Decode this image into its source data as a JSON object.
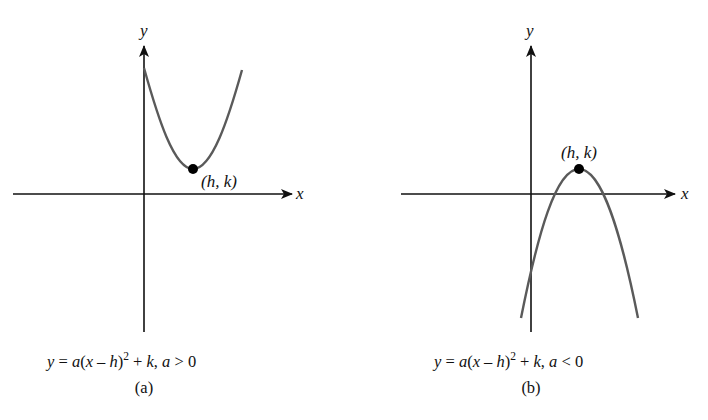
{
  "figure": {
    "panels": [
      {
        "id": "a",
        "x_axis_label": "x",
        "y_axis_label": "y",
        "vertex_label": "(h, k)",
        "equation": {
          "y": "y",
          "eq": " = ",
          "a": "a",
          "open": "(",
          "x": "x",
          "minus": " – ",
          "h": "h",
          "close": ")",
          "exp": "2",
          "plus": " + ",
          "k": "k",
          "comma": ", ",
          "a2": "a",
          "cond": " > 0"
        },
        "sublabel": "(a)",
        "opens": "up"
      },
      {
        "id": "b",
        "x_axis_label": "x",
        "y_axis_label": "y",
        "vertex_label": "(h, k)",
        "equation": {
          "y": "y",
          "eq": " = ",
          "a": "a",
          "open": "(",
          "x": "x",
          "minus": " – ",
          "h": "h",
          "close": ")",
          "exp": "2",
          "plus": " + ",
          "k": "k",
          "comma": ", ",
          "a2": "a",
          "cond": " < 0"
        },
        "sublabel": "(b)",
        "opens": "down"
      }
    ],
    "colors": {
      "axis": "#111111",
      "curve": "#5a5a5a",
      "vertex": "#000000",
      "background": "#ffffff"
    }
  }
}
